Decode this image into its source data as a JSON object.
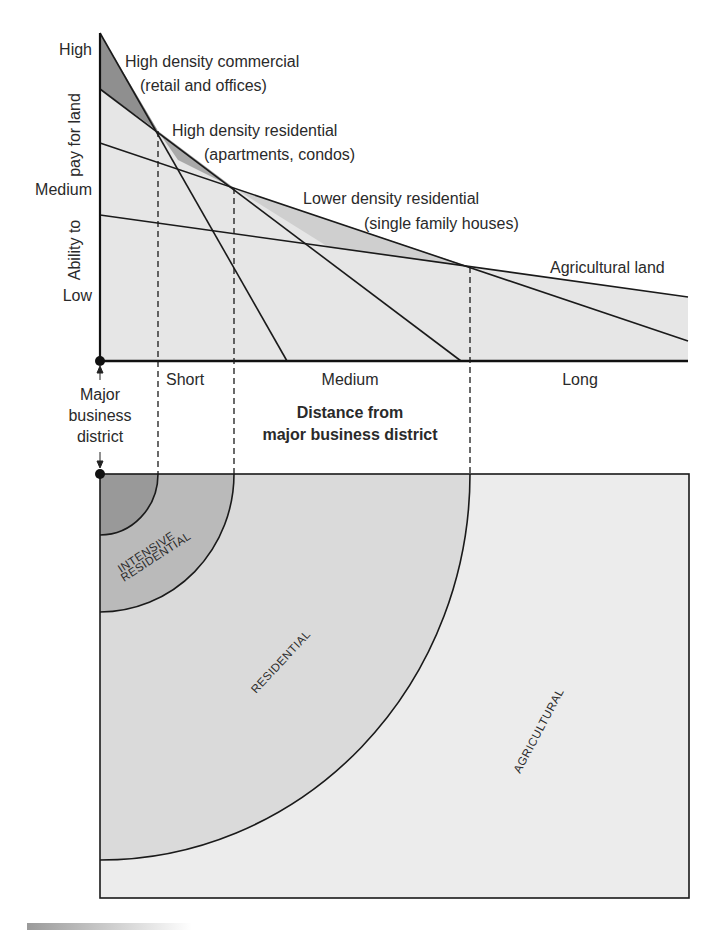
{
  "y_axis": {
    "title_line1": "Ability to",
    "title_line2": "pay for land",
    "ticks": [
      "High",
      "Medium",
      "Low"
    ]
  },
  "x_axis": {
    "ticks": [
      "Short",
      "Medium",
      "Long"
    ],
    "title_line1": "Distance from",
    "title_line2": "major business district",
    "origin_line1": "Major",
    "origin_line2": "business",
    "origin_line3": "district"
  },
  "curves": {
    "commercial_line1": "High density commercial",
    "commercial_line2": "(retail and offices)",
    "high_res_line1": "High density residential",
    "high_res_line2": "(apartments, condos)",
    "low_res_line1": "Lower density residential",
    "low_res_line2": "(single family houses)",
    "agri": "Agricultural land"
  },
  "map": {
    "zone_intensive_1": "INTENSIVE",
    "zone_intensive_2": "RESIDENTIAL",
    "zone_residential": "RESIDENTIAL",
    "zone_agricultural": "AGRICULTURAL"
  },
  "colors": {
    "dark_fill": "#8f8f8f",
    "mid_fill": "#bdbdbd",
    "light_fill": "#e4e4e4",
    "lightest_fill": "#ececec",
    "line": "#1a1a1a"
  }
}
